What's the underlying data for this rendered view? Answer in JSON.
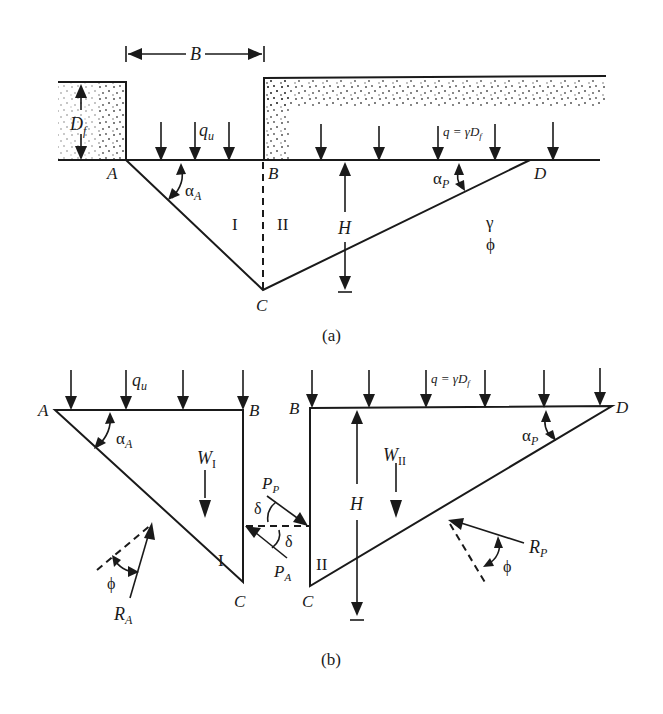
{
  "figure": {
    "subfigure_a": {
      "caption": "(a)",
      "points": {
        "A": "A",
        "B": "B",
        "C": "C",
        "D": "D"
      },
      "dimension_width": "B",
      "dimension_depth_main": "D",
      "dimension_depth_sub": "f",
      "footing_load_main": "q",
      "footing_load_sub": "u",
      "surcharge_label": "q = γD",
      "surcharge_label_sub": "f",
      "angle_active_main": "α",
      "angle_active_sub": "A",
      "angle_passive_main": "α",
      "angle_passive_sub": "P",
      "height_label": "H",
      "zone_1": "I",
      "zone_2": "II",
      "soil_unit_weight": "γ",
      "soil_friction_angle": "ϕ"
    },
    "subfigure_b": {
      "caption": "(b)",
      "wedge_1": {
        "points": {
          "A": "A",
          "B": "B",
          "C": "C"
        },
        "load_main": "q",
        "load_sub": "u",
        "angle_main": "α",
        "angle_sub": "A",
        "weight_main": "W",
        "weight_sub": "I",
        "zone": "I",
        "reaction_main": "R",
        "reaction_sub": "A",
        "friction_angle": "ϕ"
      },
      "interface": {
        "passive_force_main": "P",
        "passive_force_sub": "P",
        "active_force_main": "P",
        "active_force_sub": "A",
        "wall_friction_1": "δ",
        "wall_friction_2": "δ"
      },
      "wedge_2": {
        "points": {
          "B": "B",
          "C": "C",
          "D": "D"
        },
        "surcharge_label": "q = γD",
        "surcharge_label_sub": "f",
        "angle_main": "α",
        "angle_sub": "P",
        "weight_main": "W",
        "weight_sub": "II",
        "zone": "II",
        "height_label": "H",
        "reaction_main": "R",
        "reaction_sub": "P",
        "friction_angle": "ϕ"
      }
    }
  }
}
